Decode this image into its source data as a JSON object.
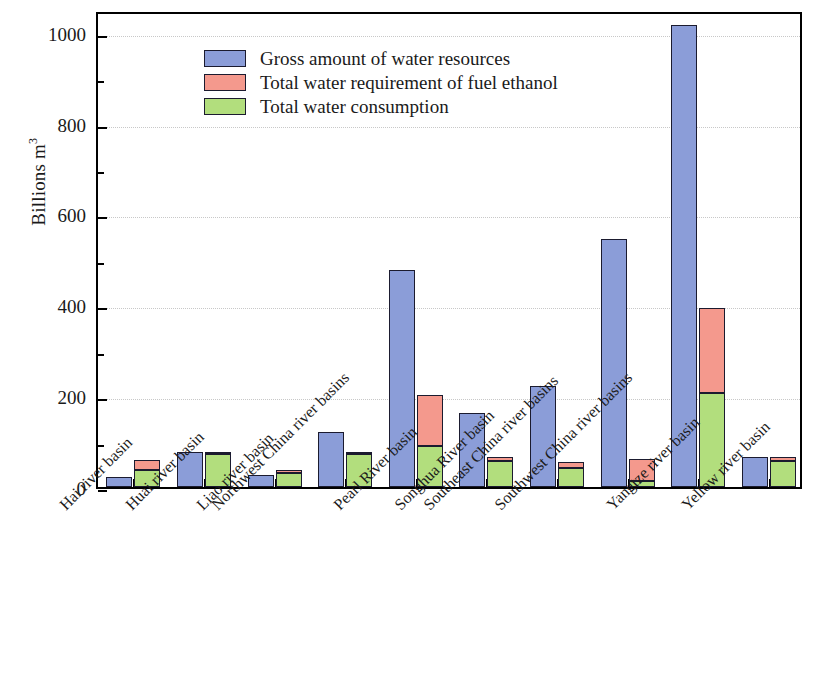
{
  "chart_data": {
    "type": "bar",
    "title": "",
    "subtitle": "",
    "xlabel": "",
    "ylabel": "Billions m",
    "ylabel_exponent": "3",
    "ylim": [
      0,
      1050
    ],
    "ytick_values": [
      0,
      200,
      400,
      600,
      800,
      1000
    ],
    "ytick_labels": [
      "0",
      "200",
      "400",
      "600",
      "800",
      "1000"
    ],
    "yminor_values": [
      100,
      300,
      500,
      700,
      900
    ],
    "grid": "horizontal-dotted",
    "legend_position": "upper-left-inside",
    "bar_style": "grouped-with-stacked-second-bar",
    "categories": [
      "Hai river basin",
      "Huai river basin",
      "Liao river basin",
      "Northwest China river basins",
      "Pearl River basin",
      "Songhua River basin",
      "Southeast China river basins",
      "Southwest China river basins",
      "Yangtze river basin",
      "Yellow river basin"
    ],
    "series": [
      {
        "name": "Gross amount of water resources",
        "color": "#8b9dd8",
        "values": [
          22,
          76,
          27,
          121,
          478,
          162,
          223,
          546,
          1017,
          67
        ]
      },
      {
        "name": "Total water requirement of fuel ethanol",
        "color": "#f4998d",
        "values": [
          60,
          77,
          37,
          78,
          203,
          66,
          55,
          62,
          393,
          66
        ],
        "note": "stacked top value (cumulative total)"
      },
      {
        "name": "Total water consumption",
        "color": "#b2de7d",
        "values": [
          37,
          72,
          30,
          73,
          90,
          57,
          42,
          13,
          208,
          57
        ],
        "note": "stacked bottom segment"
      }
    ]
  },
  "legend": {
    "items": [
      {
        "label": "Gross amount of water resources",
        "color": "#8b9dd8",
        "swatch_name": "legend-swatch-blue"
      },
      {
        "label": "Total water requirement of fuel ethanol",
        "color": "#f4998d",
        "swatch_name": "legend-swatch-red"
      },
      {
        "label": "Total water consumption",
        "color": "#b2de7d",
        "swatch_name": "legend-swatch-green"
      }
    ]
  }
}
